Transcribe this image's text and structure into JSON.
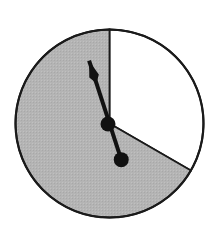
{
  "diagram": {
    "type": "spinner",
    "sectors": [
      {
        "name": "white",
        "color": "#ffffff",
        "fraction": 0.333,
        "start_deg": 0,
        "end_deg": 120
      },
      {
        "name": "gray",
        "color": "#b4b4b4",
        "fraction": 0.667,
        "start_deg": 120,
        "end_deg": 360
      }
    ],
    "pointer": {
      "angle_deg": 342,
      "color": "#111111"
    },
    "outline_color": "#1a1a1a"
  }
}
